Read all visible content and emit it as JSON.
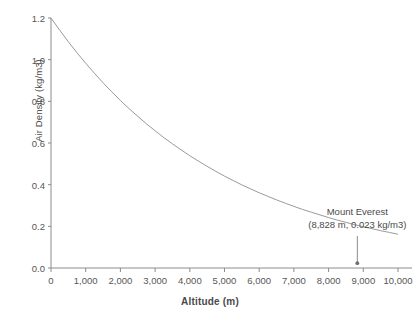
{
  "chart_data": {
    "type": "line",
    "title": "",
    "xlabel": "Altitude (m)",
    "ylabel": "Air Density (kg/m3)",
    "xlim": [
      0,
      10000
    ],
    "ylim": [
      0.0,
      1.2
    ],
    "grid": false,
    "legend": "none",
    "x_ticks": [
      0,
      1000,
      2000,
      3000,
      4000,
      5000,
      6000,
      7000,
      8000,
      9000,
      10000
    ],
    "x_tick_labels": [
      "0",
      "1,000",
      "2,000",
      "3,000",
      "4,000",
      "5,000",
      "6,000",
      "7,000",
      "8,000",
      "9,000",
      "10,000"
    ],
    "y_ticks": [
      0.0,
      0.2,
      0.4,
      0.6,
      0.8,
      1.0,
      1.2
    ],
    "y_tick_labels": [
      "0.0",
      "0.2",
      "0.4",
      "0.6",
      "0.8",
      "1.0",
      "1.2"
    ],
    "series": [
      {
        "name": "Air Density",
        "color": "#9a9a9a",
        "x": [
          0,
          250,
          500,
          750,
          1000,
          1250,
          1500,
          1750,
          2000,
          2250,
          2500,
          2750,
          3000,
          3250,
          3500,
          3750,
          4000,
          4250,
          4500,
          4750,
          5000,
          5250,
          5500,
          5750,
          6000,
          6250,
          6500,
          6750,
          7000,
          7250,
          7500,
          7750,
          8000,
          8250,
          8500,
          8750,
          9000,
          9250,
          9500,
          9750,
          10000
        ],
        "values": [
          1.2,
          1.142,
          1.086,
          1.033,
          0.983,
          0.935,
          0.889,
          0.846,
          0.804,
          0.765,
          0.728,
          0.692,
          0.659,
          0.626,
          0.596,
          0.567,
          0.539,
          0.513,
          0.488,
          0.464,
          0.441,
          0.42,
          0.399,
          0.38,
          0.361,
          0.344,
          0.327,
          0.311,
          0.296,
          0.281,
          0.268,
          0.255,
          0.242,
          0.23,
          0.219,
          0.208,
          0.198,
          0.189,
          0.179,
          0.171,
          0.162
        ]
      }
    ],
    "annotations": [
      {
        "label_line1": "Mount Everest",
        "label_line2": "(8,828 m, 0.023 kg/m3)",
        "x": 8828,
        "y": 0.023,
        "marker": "point",
        "leader": "vertical-line"
      }
    ]
  },
  "axis": {
    "line_color": "#8c8c8c",
    "tick_color": "#8c8c8c"
  }
}
